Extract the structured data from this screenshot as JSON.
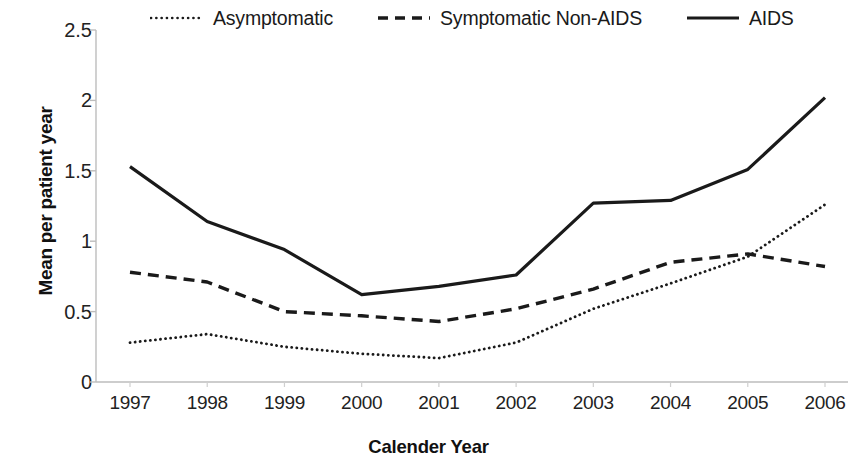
{
  "chart_data": {
    "type": "line",
    "title": "",
    "xlabel": "Calender Year",
    "ylabel": "Mean per patient year",
    "categories": [
      "1997",
      "1998",
      "1999",
      "2000",
      "2001",
      "2002",
      "2003",
      "2004",
      "2005",
      "2006"
    ],
    "x": [
      1997,
      1998,
      1999,
      2000,
      2001,
      2002,
      2003,
      2004,
      2005,
      2006
    ],
    "xlim": [
      1997,
      2006
    ],
    "ylim": [
      0,
      2.5
    ],
    "yticks": [
      "0",
      "0.5",
      "1",
      "1.5",
      "2",
      "2.5"
    ],
    "ytick_values": [
      0,
      0.5,
      1,
      1.5,
      2,
      2.5
    ],
    "grid": false,
    "legend_position": "top",
    "series": [
      {
        "name": "Asymptomatic",
        "style": "dotted",
        "color": "#1a1a1a",
        "values": [
          0.28,
          0.34,
          0.25,
          0.2,
          0.17,
          0.28,
          0.52,
          0.7,
          0.89,
          1.26
        ]
      },
      {
        "name": "Symptomatic Non-AIDS",
        "style": "dashed",
        "color": "#1a1a1a",
        "values": [
          0.78,
          0.71,
          0.5,
          0.47,
          0.43,
          0.52,
          0.66,
          0.85,
          0.91,
          0.82
        ]
      },
      {
        "name": "AIDS",
        "style": "solid",
        "color": "#1a1a1a",
        "values": [
          1.53,
          1.14,
          0.94,
          0.62,
          0.68,
          0.76,
          1.27,
          1.29,
          1.51,
          2.02
        ]
      }
    ]
  },
  "axes": {
    "y_title": "Mean per patient year",
    "x_title": "Calender Year"
  },
  "legend": {
    "items": [
      {
        "label": "Asymptomatic",
        "style": "dotted"
      },
      {
        "label": "Symptomatic Non-AIDS",
        "style": "dashed"
      },
      {
        "label": "AIDS",
        "style": "solid"
      }
    ]
  },
  "colors": {
    "ink": "#1a1a1a",
    "axis": "#b8b8b8",
    "background": "#ffffff"
  }
}
